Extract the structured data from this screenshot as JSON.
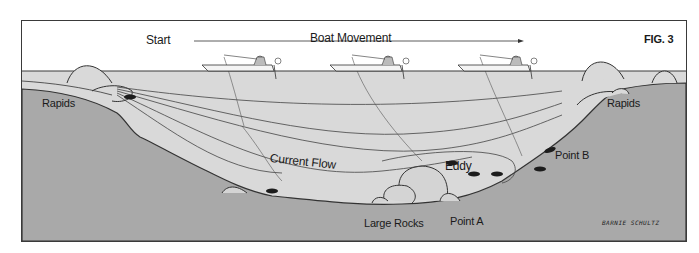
{
  "figure": {
    "label": "FIG. 3",
    "signature": "BARNIE SCHULTZ"
  },
  "header": {
    "start_label": "Start",
    "movement_label": "Boat Movement"
  },
  "labels": {
    "rapids_left": "Rapids",
    "rapids_right": "Rapids",
    "current_flow": "Current Flow",
    "eddy": "Eddy",
    "point_a": "Point A",
    "point_b": "Point B",
    "large_rocks": "Large Rocks"
  },
  "boats": [
    {
      "position": 1,
      "x": 180
    },
    {
      "position": 2,
      "x": 308
    },
    {
      "position": 3,
      "x": 436
    }
  ],
  "colors": {
    "sky": "#ffffff",
    "water": "#d9d9d9",
    "bed": "#a9a9a9",
    "line": "#3a3a3a",
    "fish": "#1c1c1c"
  }
}
